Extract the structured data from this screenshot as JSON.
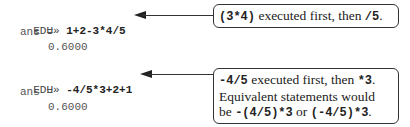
{
  "examples": [
    {
      "prompt": "EDU»",
      "command": "1+2-3*4/5",
      "ans_label": "ans =",
      "result": "0.6000",
      "callout": {
        "lines": [
          [
            {
              "code": "(3*4)"
            },
            {
              "text": " executed first, then "
            },
            {
              "code": "/5"
            },
            {
              "text": "."
            }
          ]
        ]
      }
    },
    {
      "prompt": "EDU»",
      "command": "-4/5*3+2+1",
      "ans_label": "ans =",
      "result": "0.6000",
      "callout": {
        "lines": [
          [
            {
              "code": "-4/5"
            },
            {
              "text": " executed first, then "
            },
            {
              "code": "*3"
            },
            {
              "text": "."
            }
          ],
          [
            {
              "text": "Equivalent statements would"
            }
          ],
          [
            {
              "text": "be "
            },
            {
              "code": "-(4/5)*3"
            },
            {
              "text": " or "
            },
            {
              "code": "(-4/5)*3"
            },
            {
              "text": "."
            }
          ]
        ]
      }
    }
  ]
}
